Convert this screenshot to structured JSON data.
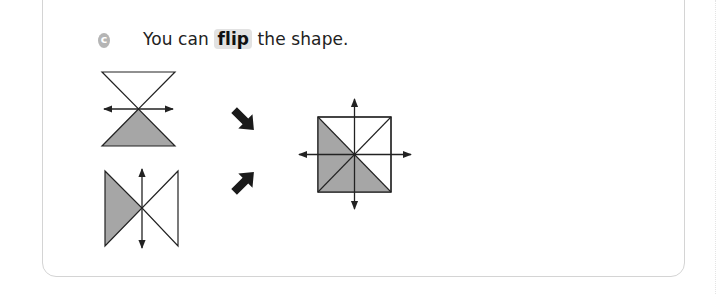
{
  "section": {
    "badge_label": "c",
    "instruction_before": "You can ",
    "instruction_highlight": "flip",
    "instruction_after": " the shape.",
    "highlight_color": "#e2e2e2"
  },
  "figures": {
    "shape_a": "hourglass with horizontal mirror line, bottom triangle shaded",
    "shape_b": "bowtie with vertical mirror line, left triangle shaded",
    "result": "square with both mirror lines, left and bottom triangles shaded",
    "fill_color": "#a6a6a6",
    "stroke_color": "#222222"
  }
}
